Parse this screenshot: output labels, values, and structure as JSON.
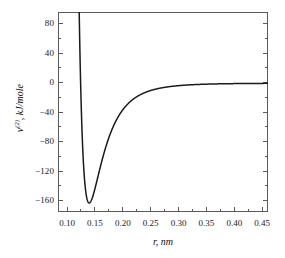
{
  "chart_data": {
    "type": "line",
    "title": "",
    "xlabel": "r, nm",
    "ylabel_main": "v",
    "ylabel_sup": "(2)",
    "ylabel_rest": ", kJ/mole",
    "ylabel_full": "v(2), kJ/mole",
    "xlim": [
      0.085,
      0.462
    ],
    "ylim": [
      -172,
      95
    ],
    "xticks": [
      0.1,
      0.15,
      0.2,
      0.25,
      0.3,
      0.35,
      0.4,
      0.45
    ],
    "xtick_labels": [
      "0.10",
      "0.15",
      "0.20",
      "0.25",
      "0.30",
      "0.35",
      "0.40",
      "0.45"
    ],
    "yticks": [
      80,
      40,
      0,
      -40,
      -80,
      -120,
      -160
    ],
    "ytick_labels": [
      "80",
      "40",
      "0",
      "−40",
      "−80",
      "−120",
      "−160"
    ],
    "grid": false,
    "legend": null,
    "line_color": "#1a1a1a",
    "frame_color": "#5a5a5a",
    "series": [
      {
        "name": "Lennard-Jones 6-12 potential",
        "well_depth_kj_per_mole": -160,
        "r_min_nm": 0.141,
        "sigma_nm": 0.1256,
        "x": [
          0.114,
          0.115,
          0.116,
          0.117,
          0.118,
          0.119,
          0.12,
          0.122,
          0.124,
          0.1256,
          0.127,
          0.129,
          0.131,
          0.133,
          0.135,
          0.137,
          0.139,
          0.141,
          0.143,
          0.145,
          0.147,
          0.15,
          0.155,
          0.16,
          0.165,
          0.17,
          0.175,
          0.18,
          0.19,
          0.2,
          0.21,
          0.22,
          0.23,
          0.24,
          0.25,
          0.26,
          0.28,
          0.3,
          0.32,
          0.34,
          0.36,
          0.38,
          0.4,
          0.42,
          0.44,
          0.46
        ],
        "y": [
          433.0,
          349.0,
          278.0,
          217.0,
          165.0,
          120.0,
          82.0,
          21.0,
          -24.0,
          -49.0,
          -67.0,
          -89.0,
          -106.0,
          -120.0,
          -131.0,
          -139.0,
          -145.0,
          -148.0,
          -149.0,
          -149.0,
          -148.0,
          -145.0,
          -136.0,
          -125.0,
          -114.0,
          -103.0,
          -92.0,
          -82.0,
          -65.0,
          -52.0,
          -41.0,
          -33.0,
          -26.0,
          -21.0,
          -17.0,
          -14.0,
          -9.5,
          -6.6,
          -4.7,
          -3.4,
          -2.6,
          -2.0,
          -1.5,
          -1.2,
          -1.0,
          -0.8
        ]
      }
    ]
  },
  "axes": {
    "x_title": "r, nm",
    "y_title": "v(2), kJ/mole"
  }
}
